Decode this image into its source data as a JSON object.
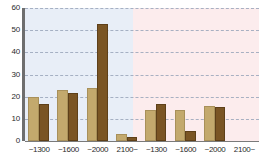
{
  "chart_data": {
    "type": "bar",
    "title": "",
    "subtitle": "",
    "xlabel": "",
    "ylabel": "",
    "ylim": [
      0,
      60
    ],
    "ytick_labels": [
      "0",
      "10",
      "20",
      "30",
      "40",
      "50",
      "60"
    ],
    "ytick_values": [
      0,
      10,
      20,
      30,
      40,
      50,
      60
    ],
    "grid": true,
    "legend_position": "none",
    "categories": [
      "~1300",
      "~1600",
      "~2000",
      "2100~",
      "~1300",
      "~1600",
      "~2000",
      "2100~"
    ],
    "groups": [
      {
        "name": "left-panel",
        "background_color": "#e8eef7",
        "categories": [
          "~1300",
          "~1600",
          "~2000",
          "2100~"
        ]
      },
      {
        "name": "right-panel",
        "background_color": "#fceced",
        "categories": [
          "~1300",
          "~1600",
          "~2000",
          "2100~"
        ]
      }
    ],
    "series": [
      {
        "name": "light-bar",
        "color": "#c3a96d",
        "values": [
          20,
          23,
          24,
          3,
          14,
          14,
          16,
          0
        ]
      },
      {
        "name": "dark-bar",
        "color": "#7a5524",
        "values": [
          16.5,
          21.5,
          53,
          2,
          16.5,
          4.5,
          15.5,
          0
        ]
      }
    ],
    "axis_color": "#6e6e6e",
    "gridline_color": "#9aa6bb"
  }
}
